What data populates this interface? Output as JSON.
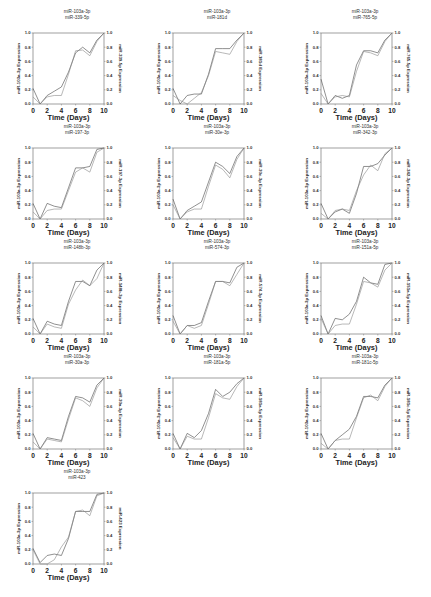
{
  "figure": {
    "x_label": "Time (Days)",
    "x_ticks": [
      "0",
      "2",
      "4",
      "6",
      "8",
      "10"
    ],
    "y_ticks": [
      "0.0",
      "0.2",
      "0.4",
      "0.6",
      "0.8",
      "1.0"
    ],
    "line_colors": {
      "primary": "#444444",
      "secondary": "#888888"
    }
  },
  "chart_data": [
    {
      "type": "line",
      "title": "miR-103a-3p / miR-339-5p",
      "title_lines": [
        "miR-103a-3p",
        "miR-339-5p"
      ],
      "xlabel": "Time (Days)",
      "ylabel": "miR-103a-3p Expression",
      "ylabel_right": "miR-339-5p Expression",
      "x": [
        0,
        1,
        2,
        3,
        4,
        5,
        6,
        7,
        8,
        9,
        10
      ],
      "xlim": [
        0,
        10
      ],
      "ylim": [
        0,
        1
      ],
      "series": [
        {
          "name": "miR-103a-3p",
          "values": [
            0.22,
            0.0,
            0.12,
            0.18,
            0.24,
            0.45,
            0.72,
            0.8,
            0.72,
            0.9,
            1.0
          ]
        },
        {
          "name": "miR-339-5p",
          "values": [
            0.1,
            0.0,
            0.1,
            0.12,
            0.12,
            0.42,
            0.75,
            0.76,
            0.68,
            0.88,
            1.0
          ]
        }
      ]
    },
    {
      "type": "line",
      "title": "miR-103a-3p / miR-181d",
      "title_lines": [
        "miR-103a-3p",
        "miR-181d"
      ],
      "xlabel": "Time (Days)",
      "ylabel": "miR-103a-3p Expression",
      "ylabel_right": "miR-181d Expression",
      "x": [
        0,
        1,
        2,
        3,
        4,
        5,
        6,
        7,
        8,
        9,
        10
      ],
      "xlim": [
        0,
        10
      ],
      "ylim": [
        0,
        1
      ],
      "series": [
        {
          "name": "miR-103a-3p",
          "values": [
            0.22,
            0.0,
            0.12,
            0.14,
            0.14,
            0.42,
            0.78,
            0.78,
            0.78,
            0.9,
            1.0
          ]
        },
        {
          "name": "miR-181d",
          "values": [
            0.12,
            0.05,
            0.0,
            0.08,
            0.16,
            0.4,
            0.74,
            0.72,
            0.7,
            0.88,
            1.0
          ]
        }
      ]
    },
    {
      "type": "line",
      "title": "miR-103a-3p / miR-765-5p",
      "title_lines": [
        "miR-103a-3p",
        "miR-765-5p"
      ],
      "xlabel": "Time (Days)",
      "ylabel": "miR-103a-3p Expression",
      "ylabel_right": "miR-765-5p Expression",
      "x": [
        0,
        1,
        2,
        3,
        4,
        5,
        6,
        7,
        8,
        9,
        10
      ],
      "xlim": [
        0,
        10
      ],
      "ylim": [
        0,
        1
      ],
      "series": [
        {
          "name": "miR-103a-3p",
          "values": [
            0.35,
            0.0,
            0.12,
            0.08,
            0.12,
            0.55,
            0.75,
            0.75,
            0.72,
            0.9,
            1.0
          ]
        },
        {
          "name": "miR-765-5p",
          "values": [
            0.15,
            0.0,
            0.1,
            0.12,
            0.1,
            0.46,
            0.74,
            0.72,
            0.68,
            0.88,
            1.0
          ]
        }
      ]
    },
    {
      "type": "line",
      "title": "miR-103a-3p / miR-197-3p",
      "title_lines": [
        "miR-103a-3p",
        "miR-197-3p"
      ],
      "xlabel": "Time (Days)",
      "ylabel": "miR-103a-3p Expression",
      "ylabel_right": "miR-197-3p Expression",
      "x": [
        0,
        1,
        2,
        3,
        4,
        5,
        6,
        7,
        8,
        9,
        10
      ],
      "xlim": [
        0,
        10
      ],
      "ylim": [
        0,
        1
      ],
      "series": [
        {
          "name": "miR-103a-3p",
          "values": [
            0.22,
            0.0,
            0.22,
            0.18,
            0.16,
            0.44,
            0.72,
            0.72,
            0.74,
            0.98,
            1.0
          ]
        },
        {
          "name": "miR-197-3p",
          "values": [
            0.1,
            0.0,
            0.12,
            0.14,
            0.14,
            0.4,
            0.66,
            0.72,
            0.66,
            0.94,
            1.0
          ]
        }
      ]
    },
    {
      "type": "line",
      "title": "miR-103a-3p / miR-30e-3p",
      "title_lines": [
        "miR-103a-3p",
        "miR-30e-3p"
      ],
      "xlabel": "Time (Days)",
      "ylabel": "miR-103a-3p Expression",
      "ylabel_right": "miR-30e-3p Expression",
      "x": [
        0,
        1,
        2,
        3,
        4,
        5,
        6,
        7,
        8,
        9,
        10
      ],
      "xlim": [
        0,
        10
      ],
      "ylim": [
        0,
        1
      ],
      "series": [
        {
          "name": "miR-103a-3p",
          "values": [
            0.28,
            0.0,
            0.12,
            0.18,
            0.24,
            0.52,
            0.8,
            0.74,
            0.64,
            0.88,
            1.0
          ]
        },
        {
          "name": "miR-30e-3p",
          "values": [
            0.2,
            0.0,
            0.1,
            0.14,
            0.14,
            0.46,
            0.76,
            0.7,
            0.58,
            0.84,
            1.0
          ]
        }
      ]
    },
    {
      "type": "line",
      "title": "miR-103a-3p / miR-342-3p",
      "title_lines": [
        "miR-103a-3p",
        "miR-342-3p"
      ],
      "xlabel": "Time (Days)",
      "ylabel": "miR-103a-3p Expression",
      "ylabel_right": "miR-342-3p Expression",
      "x": [
        0,
        1,
        2,
        3,
        4,
        5,
        6,
        7,
        8,
        9,
        10
      ],
      "xlim": [
        0,
        10
      ],
      "ylim": [
        0,
        1
      ],
      "series": [
        {
          "name": "miR-103a-3p",
          "values": [
            0.22,
            0.0,
            0.1,
            0.14,
            0.08,
            0.36,
            0.74,
            0.74,
            0.78,
            0.9,
            1.0
          ]
        },
        {
          "name": "miR-342-3p",
          "values": [
            0.08,
            0.0,
            0.12,
            0.14,
            0.12,
            0.4,
            0.62,
            0.76,
            0.68,
            0.92,
            1.0
          ]
        }
      ]
    },
    {
      "type": "line",
      "title": "miR-103a-3p / miR-148b-3p",
      "title_lines": [
        "miR-103a-3p",
        "miR-148b-3p"
      ],
      "xlabel": "Time (Days)",
      "ylabel": "miR-103a-3p Expression",
      "ylabel_right": "miR-148b-3p Expression",
      "x": [
        0,
        1,
        2,
        3,
        4,
        5,
        6,
        7,
        8,
        9,
        10
      ],
      "xlim": [
        0,
        10
      ],
      "ylim": [
        0,
        1
      ],
      "series": [
        {
          "name": "miR-103a-3p",
          "values": [
            0.22,
            0.0,
            0.18,
            0.14,
            0.12,
            0.46,
            0.74,
            0.74,
            0.68,
            0.9,
            1.0
          ]
        },
        {
          "name": "miR-148b-3p",
          "values": [
            0.1,
            0.0,
            0.14,
            0.1,
            0.08,
            0.42,
            0.62,
            0.76,
            0.68,
            0.78,
            1.0
          ]
        }
      ]
    },
    {
      "type": "line",
      "title": "miR-103a-3p / miR-574-3p",
      "title_lines": [
        "miR-103a-3p",
        "miR-574-3p"
      ],
      "xlabel": "Time (Days)",
      "ylabel": "miR-103a-3p Expression",
      "ylabel_right": "miR-574-3p Expression",
      "x": [
        0,
        1,
        2,
        3,
        4,
        5,
        6,
        7,
        8,
        9,
        10
      ],
      "xlim": [
        0,
        10
      ],
      "ylim": [
        0,
        1
      ],
      "series": [
        {
          "name": "miR-103a-3p",
          "values": [
            0.26,
            0.0,
            0.12,
            0.12,
            0.16,
            0.46,
            0.74,
            0.74,
            0.72,
            0.94,
            1.0
          ]
        },
        {
          "name": "miR-574-3p",
          "values": [
            0.18,
            0.0,
            0.12,
            0.08,
            0.12,
            0.42,
            0.74,
            0.74,
            0.68,
            0.84,
            1.0
          ]
        }
      ]
    },
    {
      "type": "line",
      "title": "miR-103a-3p / miR-151a-5p",
      "title_lines": [
        "miR-103a-3p",
        "miR-151a-5p"
      ],
      "xlabel": "Time (Days)",
      "ylabel": "miR-103a-3p Expression",
      "ylabel_right": "miR-151a-5p Expression",
      "x": [
        0,
        1,
        2,
        3,
        4,
        5,
        6,
        7,
        8,
        9,
        10
      ],
      "xlim": [
        0,
        10
      ],
      "ylim": [
        0,
        1
      ],
      "series": [
        {
          "name": "miR-103a-3p",
          "values": [
            0.26,
            0.0,
            0.22,
            0.2,
            0.28,
            0.46,
            0.8,
            0.72,
            0.7,
            0.98,
            1.0
          ]
        },
        {
          "name": "miR-151a-5p",
          "values": [
            0.22,
            0.0,
            0.12,
            0.14,
            0.14,
            0.42,
            0.74,
            0.72,
            0.66,
            0.9,
            1.0
          ]
        }
      ]
    },
    {
      "type": "line",
      "title": "miR-103a-3p / miR-30a-3p",
      "title_lines": [
        "miR-103a-3p",
        "miR-30a-3p"
      ],
      "xlabel": "Time (Days)",
      "ylabel": "miR-103a-3p Expression",
      "ylabel_right": "miR-30a-3p Expression",
      "x": [
        0,
        1,
        2,
        3,
        4,
        5,
        6,
        7,
        8,
        9,
        10
      ],
      "xlim": [
        0,
        10
      ],
      "ylim": [
        0,
        1
      ],
      "series": [
        {
          "name": "miR-103a-3p",
          "values": [
            0.22,
            0.0,
            0.16,
            0.14,
            0.12,
            0.46,
            0.74,
            0.72,
            0.66,
            0.9,
            1.0
          ]
        },
        {
          "name": "miR-30a-3p",
          "values": [
            0.1,
            0.0,
            0.14,
            0.12,
            0.1,
            0.42,
            0.72,
            0.68,
            0.6,
            0.86,
            1.0
          ]
        }
      ]
    },
    {
      "type": "line",
      "title": "miR-103a-3p / miR-181a-5p",
      "title_lines": [
        "miR-103a-3p",
        "miR-181a-5p"
      ],
      "xlabel": "Time (Days)",
      "ylabel": "miR-103a-3p Expression",
      "ylabel_right": "miR-181a-5p Expression",
      "x": [
        0,
        1,
        2,
        3,
        4,
        5,
        6,
        7,
        8,
        9,
        10
      ],
      "xlim": [
        0,
        10
      ],
      "ylim": [
        0,
        1
      ],
      "series": [
        {
          "name": "miR-103a-3p",
          "values": [
            0.22,
            0.0,
            0.22,
            0.16,
            0.26,
            0.5,
            0.84,
            0.74,
            0.8,
            0.92,
            1.0
          ]
        },
        {
          "name": "miR-181a-5p",
          "values": [
            0.16,
            0.0,
            0.18,
            0.14,
            0.14,
            0.44,
            0.78,
            0.72,
            0.7,
            0.88,
            1.0
          ]
        }
      ]
    },
    {
      "type": "line",
      "title": "miR-103a-3p / miR-181c-5p",
      "title_lines": [
        "miR-103a-3p",
        "miR-181c-5p"
      ],
      "xlabel": "Time (Days)",
      "ylabel": "miR-103a-3p Expression",
      "ylabel_right": "miR-181c-5p Expression",
      "x": [
        0,
        1,
        2,
        3,
        4,
        5,
        6,
        7,
        8,
        9,
        10
      ],
      "xlim": [
        0,
        10
      ],
      "ylim": [
        0,
        1
      ],
      "series": [
        {
          "name": "miR-103a-3p",
          "values": [
            0.22,
            0.0,
            0.12,
            0.2,
            0.28,
            0.46,
            0.74,
            0.74,
            0.72,
            0.9,
            1.0
          ]
        },
        {
          "name": "miR-181c-5p",
          "values": [
            0.08,
            0.0,
            0.12,
            0.14,
            0.14,
            0.44,
            0.72,
            0.76,
            0.68,
            0.88,
            1.0
          ]
        }
      ]
    },
    {
      "type": "line",
      "title": "miR-103a-3p / miR-423",
      "title_lines": [
        "miR-103a-3p",
        "miR-423"
      ],
      "xlabel": "Time (Days)",
      "ylabel": "miR-103a-3p Expression",
      "ylabel_right": "miR-423 Expression",
      "x": [
        0,
        1,
        2,
        3,
        4,
        5,
        6,
        7,
        8,
        9,
        10
      ],
      "xlim": [
        0,
        10
      ],
      "ylim": [
        0,
        1
      ],
      "series": [
        {
          "name": "miR-103a-3p",
          "values": [
            0.22,
            0.02,
            0.12,
            0.14,
            0.12,
            0.36,
            0.74,
            0.74,
            0.74,
            0.98,
            1.0
          ]
        },
        {
          "name": "miR-423",
          "values": [
            0.2,
            0.0,
            0.0,
            0.06,
            0.24,
            0.38,
            0.74,
            0.76,
            0.68,
            0.96,
            1.0
          ]
        }
      ]
    }
  ]
}
